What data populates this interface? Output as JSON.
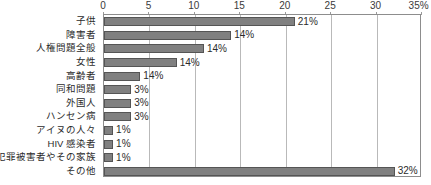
{
  "chart_data": {
    "type": "bar",
    "orientation": "horizontal",
    "title": "",
    "subtitle": "",
    "xlabel": "",
    "ylabel": "",
    "xlim": [
      0,
      35
    ],
    "grid": true,
    "legend": null,
    "axis_unit_suffix": "%",
    "xticks": [
      {
        "value": 0,
        "label": "0"
      },
      {
        "value": 5,
        "label": "5"
      },
      {
        "value": 10,
        "label": "10"
      },
      {
        "value": 15,
        "label": "15"
      },
      {
        "value": 20,
        "label": "20"
      },
      {
        "value": 25,
        "label": "25"
      },
      {
        "value": 30,
        "label": "30"
      },
      {
        "value": 35,
        "label": "35%"
      }
    ],
    "categories": [
      "子供",
      "障害者",
      "人権問題全般",
      "女性",
      "高齢者",
      "同和問題",
      "外国人",
      "ハンセン病",
      "アイヌの人々",
      "HIV 感染者",
      "犯罪被害者やその家族",
      "その他"
    ],
    "values": [
      21,
      14,
      11,
      8,
      4,
      3,
      3,
      3,
      1,
      1,
      1,
      32
    ],
    "data_labels": [
      "21%",
      "14%",
      "14%",
      "14%",
      "14%",
      "3%",
      "3%",
      "3%",
      "1%",
      "1%",
      "1%",
      "32%"
    ],
    "bars": [
      {
        "category": "子供",
        "value": 21,
        "label": "21%"
      },
      {
        "category": "障害者",
        "value": 14,
        "label": "14%"
      },
      {
        "category": "人権問題全般",
        "value": 11,
        "label": "14%"
      },
      {
        "category": "女性",
        "value": 8,
        "label": "14%"
      },
      {
        "category": "高齢者",
        "value": 4,
        "label": "14%"
      },
      {
        "category": "同和問題",
        "value": 3,
        "label": "3%"
      },
      {
        "category": "外国人",
        "value": 3,
        "label": "3%"
      },
      {
        "category": "ハンセン病",
        "value": 3,
        "label": "3%"
      },
      {
        "category": "アイヌの人々",
        "value": 1,
        "label": "1%"
      },
      {
        "category": "HIV 感染者",
        "value": 1,
        "label": "1%"
      },
      {
        "category": "犯罪被害者やその家族",
        "value": 1,
        "label": "1%"
      },
      {
        "category": "その他",
        "value": 32,
        "label": "32%"
      }
    ],
    "colors": {
      "bar_fill": "#808080",
      "bar_border": "#555555",
      "gridline": "#b9b9b9",
      "frame": "#8d8d8d",
      "text": "#2b2b2b",
      "background": "#ffffff"
    }
  }
}
